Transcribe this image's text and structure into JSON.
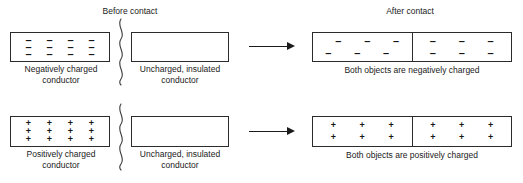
{
  "figure": {
    "headers": {
      "before": "Before contact",
      "after": "After contact"
    }
  },
  "rows": [
    {
      "id": "negative",
      "charge_symbol": "–",
      "source_box": {
        "label_line1": "Negatively charged",
        "label_line2": "conductor",
        "charge_cols": 4,
        "charge_rows": 3,
        "charge_count": 12
      },
      "neutral_box": {
        "label_line1": "Uncharged, insulated",
        "label_line2": "conductor",
        "charge_count": 0
      },
      "result_box": {
        "left_half_charges": 6,
        "right_half_charges": 6,
        "caption": "Both objects are negatively charged"
      }
    },
    {
      "id": "positive",
      "charge_symbol": "+",
      "source_box": {
        "label_line1": "Positively charged",
        "label_line2": "conductor",
        "charge_cols": 4,
        "charge_rows": 3,
        "charge_count": 12
      },
      "neutral_box": {
        "label_line1": "Uncharged, insulated",
        "label_line2": "conductor",
        "charge_count": 0
      },
      "result_box": {
        "left_half_charges": 6,
        "right_half_charges": 6,
        "caption": "Both objects are positively charged"
      }
    }
  ],
  "colors": {
    "stroke": "#2b2b2b",
    "text": "#1a1a1a",
    "background": "#ffffff"
  }
}
